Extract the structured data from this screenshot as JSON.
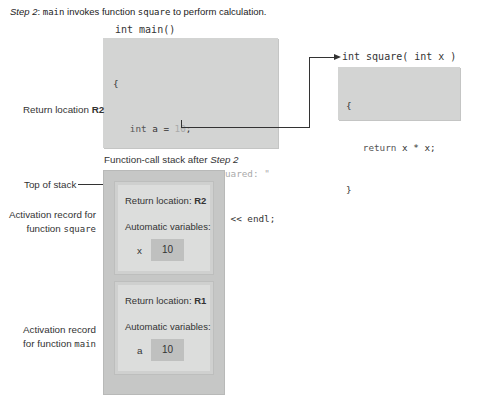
{
  "caption": {
    "step": "Step 2",
    "sep": ": ",
    "fn1": "main",
    "middle": " invokes function ",
    "fn2": "square",
    "tail": " to perform calculation."
  },
  "main_function": {
    "signature": "int main()",
    "lines": [
      "{",
      "   int a = 10;",
      "   cout << a << \" squared: \"",
      "      << square( a ) << endl;",
      "   return 0;",
      "}"
    ]
  },
  "square_function": {
    "signature": "int square( int x )",
    "lines": [
      "{",
      "   return x * x;",
      "}"
    ]
  },
  "labels": {
    "return_location_prefix": "Return location ",
    "return_location_value": "R2",
    "stack_title_prefix": "Function-call stack after ",
    "stack_title_step": "Step 2",
    "top_of_stack": "Top of stack",
    "ar_square_line1": "Activation record for",
    "ar_square_line2_prefix": "function ",
    "ar_square_fn": "square",
    "ar_main_line1": "Activation record",
    "ar_main_line2_prefix": "for function ",
    "ar_main_fn": "main"
  },
  "stack": {
    "frames": [
      {
        "function": "square",
        "return_label": "Return location: ",
        "return_value": "R2",
        "auto_vars_label": "Automatic variables:",
        "var_name": "x",
        "var_value": "10"
      },
      {
        "function": "main",
        "return_label": "Return location: ",
        "return_value": "R1",
        "auto_vars_label": "Automatic variables:",
        "var_name": "a",
        "var_value": "10"
      }
    ]
  },
  "colors": {
    "code_box": "#d3d4d3",
    "stack_outer": "#c6c7c6",
    "frame_inner": "#dcdddc",
    "var_box": "#bfc0bf",
    "literal": "#aaaaaa"
  }
}
